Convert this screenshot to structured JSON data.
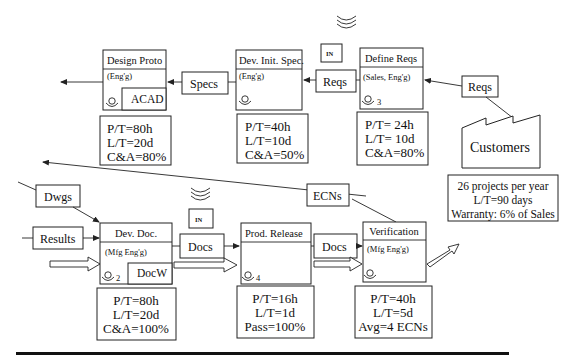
{
  "processes": [
    {
      "id": "design_proto",
      "title": "Design Proto",
      "dept": "(Eng'g)",
      "operators": "",
      "tool": "ACAD",
      "metrics": [
        "P/T=80h",
        "L/T=20d",
        "C&A=80%"
      ]
    },
    {
      "id": "dev_init_spec",
      "title": "Dev. Init. Spec.",
      "dept": "(Eng'g)",
      "operators": "",
      "tool": "",
      "metrics": [
        "P/T=40h",
        "L/T=10d",
        "C&A=50%"
      ]
    },
    {
      "id": "define_reqs",
      "title": "Define Reqs",
      "dept": "(Sales, Eng'g)",
      "operators": "3",
      "tool": "",
      "metrics": [
        "P/T= 24h",
        "L/T= 10d",
        "C&A=80%"
      ]
    },
    {
      "id": "dev_doc",
      "title": "Dev. Doc.",
      "dept": "(Mfg Eng'g)",
      "operators": "2",
      "tool": "DocW",
      "metrics": [
        "P/T=80h",
        "L/T=20d",
        "C&A=100%"
      ]
    },
    {
      "id": "prod_release",
      "title": "Prod. Release",
      "dept": "",
      "operators": "4",
      "tool": "",
      "metrics": [
        "P/T=16h",
        "L/T=1d",
        "Pass=100%"
      ]
    },
    {
      "id": "verification",
      "title": "Verification",
      "dept": "(Mfg Eng'g)",
      "operators": "",
      "tool": "",
      "metrics": [
        "P/T=40h",
        "L/T=5d",
        "Avg=4 ECNs"
      ]
    }
  ],
  "flows": {
    "specs": "Specs",
    "reqs_mid": "Reqs",
    "reqs_customer": "Reqs",
    "dwgs": "Dwgs",
    "results": "Results",
    "docs_1": "Docs",
    "docs_2": "Docs",
    "ecns": "ECNs"
  },
  "inboxes": [
    {
      "label": "IN"
    },
    {
      "label": "IN"
    }
  ],
  "customer": {
    "label": "Customers",
    "info": [
      "26 projects per year",
      "L/T=90 days",
      "Warranty: 6% of Sales"
    ]
  }
}
